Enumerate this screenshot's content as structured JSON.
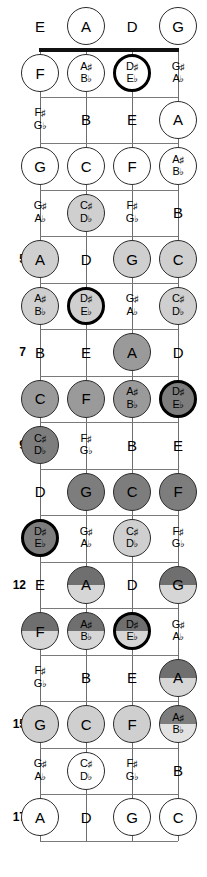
{
  "diagram": {
    "instrument": "4-string bass",
    "orientation": "vertical",
    "fret_count": 17,
    "strings": [
      "E",
      "A",
      "D",
      "G"
    ],
    "string_x": [
      40,
      86,
      132,
      178
    ],
    "nut_y": 50,
    "fret_spacing": 46.5,
    "colors": {
      "white": "#ffffff",
      "light_gray": "#cfcfcf",
      "medium_gray": "#9a9a9a",
      "dark_gray": "#7d7d7d",
      "line": "#7a7a7a",
      "nut": "#111111",
      "text": "#000000"
    },
    "fret_numbers": [
      {
        "fret": 5,
        "label": "5"
      },
      {
        "fret": 7,
        "label": "7"
      },
      {
        "fret": 9,
        "label": "9"
      },
      {
        "fret": 12,
        "label": "12"
      },
      {
        "fret": 15,
        "label": "15"
      },
      {
        "fret": 17,
        "label": "17"
      }
    ],
    "frets": [
      {
        "fret": 0,
        "shade": "white",
        "notes": [
          {
            "string": "E",
            "label": "E",
            "circle": false,
            "thick": false
          },
          {
            "string": "A",
            "label": "A",
            "circle": true,
            "thick": false
          },
          {
            "string": "D",
            "label": "D",
            "circle": false,
            "thick": false
          },
          {
            "string": "G",
            "label": "G",
            "circle": true,
            "thick": false
          }
        ]
      },
      {
        "fret": 1,
        "shade": "white",
        "notes": [
          {
            "string": "E",
            "label": "F",
            "circle": true,
            "thick": false
          },
          {
            "string": "A",
            "label": "A♯|B♭",
            "circle": true,
            "thick": false
          },
          {
            "string": "D",
            "label": "D♯|E♭",
            "circle": true,
            "thick": true
          },
          {
            "string": "G",
            "label": "G♯|A♭",
            "circle": false,
            "thick": false
          }
        ]
      },
      {
        "fret": 2,
        "shade": "white",
        "notes": [
          {
            "string": "E",
            "label": "F♯|G♭",
            "circle": false,
            "thick": false
          },
          {
            "string": "A",
            "label": "B",
            "circle": false,
            "thick": false
          },
          {
            "string": "D",
            "label": "E",
            "circle": false,
            "thick": false
          },
          {
            "string": "G",
            "label": "A",
            "circle": true,
            "thick": false
          }
        ]
      },
      {
        "fret": 3,
        "shade": "white",
        "notes": [
          {
            "string": "E",
            "label": "G",
            "circle": true,
            "thick": false
          },
          {
            "string": "A",
            "label": "C",
            "circle": true,
            "thick": false
          },
          {
            "string": "D",
            "label": "F",
            "circle": true,
            "thick": false
          },
          {
            "string": "G",
            "label": "A♯|B♭",
            "circle": true,
            "thick": false
          }
        ]
      },
      {
        "fret": 4,
        "shade": "light_gray",
        "notes": [
          {
            "string": "E",
            "label": "G♯|A♭",
            "circle": false,
            "thick": false
          },
          {
            "string": "A",
            "label": "C♯|D♭",
            "circle": true,
            "thick": false,
            "fill": "light_gray"
          },
          {
            "string": "D",
            "label": "F♯|G♭",
            "circle": false,
            "thick": false
          },
          {
            "string": "G",
            "label": "B",
            "circle": false,
            "thick": false
          }
        ]
      },
      {
        "fret": 5,
        "shade": "light_gray",
        "notes": [
          {
            "string": "E",
            "label": "A",
            "circle": true,
            "thick": false,
            "fill": "light_gray"
          },
          {
            "string": "A",
            "label": "D",
            "circle": false,
            "thick": false
          },
          {
            "string": "D",
            "label": "G",
            "circle": true,
            "thick": false,
            "fill": "light_gray"
          },
          {
            "string": "G",
            "label": "C",
            "circle": true,
            "thick": false,
            "fill": "light_gray"
          }
        ]
      },
      {
        "fret": 6,
        "shade": "light_gray",
        "notes": [
          {
            "string": "E",
            "label": "A♯|B♭",
            "circle": true,
            "thick": false,
            "fill": "light_gray"
          },
          {
            "string": "A",
            "label": "D♯|E♭",
            "circle": true,
            "thick": true,
            "fill": "light_gray"
          },
          {
            "string": "D",
            "label": "G♯|A♭",
            "circle": false,
            "thick": false
          },
          {
            "string": "G",
            "label": "C♯|D♭",
            "circle": true,
            "thick": false,
            "fill": "light_gray"
          }
        ]
      },
      {
        "fret": 7,
        "shade": "medium_gray",
        "notes": [
          {
            "string": "E",
            "label": "B",
            "circle": false,
            "thick": false
          },
          {
            "string": "A",
            "label": "E",
            "circle": false,
            "thick": false
          },
          {
            "string": "D",
            "label": "A",
            "circle": true,
            "thick": false,
            "fill": "medium_gray"
          },
          {
            "string": "G",
            "label": "D",
            "circle": false,
            "thick": false
          }
        ]
      },
      {
        "fret": 8,
        "shade": "medium_gray",
        "notes": [
          {
            "string": "E",
            "label": "C",
            "circle": true,
            "thick": false,
            "fill": "medium_gray"
          },
          {
            "string": "A",
            "label": "F",
            "circle": true,
            "thick": false,
            "fill": "medium_gray"
          },
          {
            "string": "D",
            "label": "A♯|B♭",
            "circle": true,
            "thick": false,
            "fill": "medium_gray"
          },
          {
            "string": "G",
            "label": "D♯|E♭",
            "circle": true,
            "thick": true,
            "fill": "dark_gray"
          }
        ]
      },
      {
        "fret": 9,
        "shade": "dark_gray",
        "notes": [
          {
            "string": "E",
            "label": "C♯|D♭",
            "circle": true,
            "thick": false,
            "fill": "dark_gray"
          },
          {
            "string": "A",
            "label": "F♯|G♭",
            "circle": false,
            "thick": false
          },
          {
            "string": "D",
            "label": "B",
            "circle": false,
            "thick": false
          },
          {
            "string": "G",
            "label": "E",
            "circle": false,
            "thick": false
          }
        ]
      },
      {
        "fret": 10,
        "shade": "dark_gray",
        "notes": [
          {
            "string": "E",
            "label": "D",
            "circle": false,
            "thick": false
          },
          {
            "string": "A",
            "label": "G",
            "circle": true,
            "thick": false,
            "fill": "dark_gray"
          },
          {
            "string": "D",
            "label": "C",
            "circle": true,
            "thick": false,
            "fill": "dark_gray"
          },
          {
            "string": "G",
            "label": "F",
            "circle": true,
            "thick": false,
            "fill": "dark_gray"
          }
        ]
      },
      {
        "fret": 11,
        "shade": "split",
        "notes": [
          {
            "string": "E",
            "label": "D♯|E♭",
            "circle": true,
            "thick": true,
            "fill": "dark_gray"
          },
          {
            "string": "A",
            "label": "G♯|A♭",
            "circle": false,
            "thick": false
          },
          {
            "string": "D",
            "label": "C♯|D♭",
            "circle": true,
            "thick": false,
            "fill": "light_gray"
          },
          {
            "string": "G",
            "label": "F♯|G♭",
            "circle": false,
            "thick": false
          }
        ]
      },
      {
        "fret": 12,
        "shade": "split",
        "notes": [
          {
            "string": "E",
            "label": "E",
            "circle": false,
            "thick": false
          },
          {
            "string": "A",
            "label": "A",
            "circle": true,
            "thick": false,
            "fill": "split"
          },
          {
            "string": "D",
            "label": "D",
            "circle": false,
            "thick": false
          },
          {
            "string": "G",
            "label": "G",
            "circle": true,
            "thick": false,
            "fill": "split"
          }
        ]
      },
      {
        "fret": 13,
        "shade": "split",
        "notes": [
          {
            "string": "E",
            "label": "F",
            "circle": true,
            "thick": false,
            "fill": "split"
          },
          {
            "string": "A",
            "label": "A♯|B♭",
            "circle": true,
            "thick": false,
            "fill": "split"
          },
          {
            "string": "D",
            "label": "D♯|E♭",
            "circle": true,
            "thick": true,
            "fill": "split"
          },
          {
            "string": "G",
            "label": "G♯|A♭",
            "circle": false,
            "thick": false
          }
        ]
      },
      {
        "fret": 14,
        "shade": "split",
        "notes": [
          {
            "string": "E",
            "label": "F♯|G♭",
            "circle": false,
            "thick": false
          },
          {
            "string": "A",
            "label": "B",
            "circle": false,
            "thick": false
          },
          {
            "string": "D",
            "label": "E",
            "circle": false,
            "thick": false
          },
          {
            "string": "G",
            "label": "A",
            "circle": true,
            "thick": false,
            "fill": "split"
          }
        ]
      },
      {
        "fret": 15,
        "shade": "light_gray",
        "notes": [
          {
            "string": "E",
            "label": "G",
            "circle": true,
            "thick": false,
            "fill": "light_gray"
          },
          {
            "string": "A",
            "label": "C",
            "circle": true,
            "thick": false,
            "fill": "light_gray"
          },
          {
            "string": "D",
            "label": "F",
            "circle": true,
            "thick": false,
            "fill": "light_gray"
          },
          {
            "string": "G",
            "label": "A♯|B♭",
            "circle": true,
            "thick": false,
            "fill": "split2"
          }
        ]
      },
      {
        "fret": 16,
        "shade": "white",
        "notes": [
          {
            "string": "E",
            "label": "G♯|A♭",
            "circle": false,
            "thick": false
          },
          {
            "string": "A",
            "label": "C♯|D♭",
            "circle": true,
            "thick": false,
            "fill": "white"
          },
          {
            "string": "D",
            "label": "F♯|G♭",
            "circle": false,
            "thick": false
          },
          {
            "string": "G",
            "label": "B",
            "circle": false,
            "thick": false
          }
        ]
      },
      {
        "fret": 17,
        "shade": "white",
        "notes": [
          {
            "string": "E",
            "label": "A",
            "circle": true,
            "thick": false,
            "fill": "white"
          },
          {
            "string": "A",
            "label": "D",
            "circle": false,
            "thick": false
          },
          {
            "string": "D",
            "label": "G",
            "circle": true,
            "thick": false,
            "fill": "white"
          },
          {
            "string": "G",
            "label": "C",
            "circle": true,
            "thick": false,
            "fill": "white"
          }
        ]
      }
    ]
  }
}
